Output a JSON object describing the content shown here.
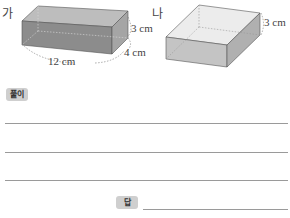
{
  "figures": {
    "a": {
      "label": "가",
      "length": "12 cm",
      "width": "4 cm",
      "height": "3 cm"
    },
    "b": {
      "label": "나",
      "height": "3 cm"
    }
  },
  "solution": {
    "label": "풀이",
    "lines": 3
  },
  "answer": {
    "label": "답"
  },
  "colors": {
    "box_a_front": "#8c8c8c",
    "box_a_top": "#bdbdbd",
    "box_a_side": "#a5a5a5",
    "box_b_front": "#c4c4c4",
    "box_b_top": "#ececec",
    "box_b_side": "#b0b0b0",
    "badge": "#cfcfcf",
    "rule": "#9a9a9a"
  }
}
